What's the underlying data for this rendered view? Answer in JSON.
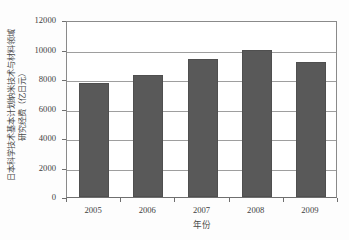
{
  "chart_data": {
    "type": "bar",
    "title": "",
    "xlabel": "年份",
    "ylabel": "日本科学技术基本计划纳米技术与材料领域研究经费（亿日元）",
    "ylabel_lines": [
      "日本科学技术基本计划纳米技术与材料领域",
      "研究经费（亿日元）"
    ],
    "categories": [
      "2005",
      "2006",
      "2007",
      "2008",
      "2009"
    ],
    "values": [
      7730,
      8270,
      9360,
      9950,
      9150
    ],
    "ylim": [
      0,
      12000
    ],
    "yticks": [
      "0",
      "2000",
      "4000",
      "6000",
      "8000",
      "10000",
      "12000"
    ],
    "ytick_values": [
      0,
      2000,
      4000,
      6000,
      8000,
      10000,
      12000
    ],
    "grid": true,
    "legend": "none",
    "series_name": "研究经费",
    "bar_color": "#595959",
    "grid_color": "#9e9e9e",
    "axis_color": "#6f6f6f",
    "background_color": "#ffffff"
  }
}
